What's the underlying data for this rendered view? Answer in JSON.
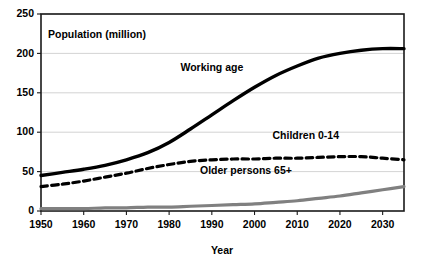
{
  "chart_data": {
    "type": "line",
    "title": "Population (million)",
    "xlabel": "Year",
    "ylabel": "",
    "xlim": [
      1950,
      2035
    ],
    "ylim": [
      0,
      250
    ],
    "grid": "horizontal",
    "legend_position": "inline-labels",
    "y_ticks": [
      0,
      50,
      100,
      150,
      200,
      250
    ],
    "x_ticks": [
      1950,
      1960,
      1970,
      1980,
      1990,
      2000,
      2010,
      2020,
      2030
    ],
    "x": [
      1950,
      1955,
      1960,
      1965,
      1970,
      1975,
      1980,
      1985,
      1990,
      1995,
      2000,
      2005,
      2010,
      2015,
      2020,
      2025,
      2030,
      2035
    ],
    "series": [
      {
        "name": "Working age",
        "color": "#000000",
        "style": "solid",
        "width": 3.4,
        "label_x": 1990,
        "label_y": 178,
        "values": [
          45,
          49,
          53,
          58,
          65,
          74,
          87,
          104,
          122,
          140,
          157,
          172,
          184,
          194,
          200,
          204,
          206,
          206
        ]
      },
      {
        "name": "Children 0-14",
        "color": "#000000",
        "style": "dashed",
        "width": 3.2,
        "label_x": 2012,
        "label_y": 92,
        "values": [
          31,
          34,
          38,
          43,
          48,
          54,
          59,
          63,
          65,
          66,
          66,
          67,
          67,
          68,
          69,
          69,
          67,
          65
        ]
      },
      {
        "name": "Older persons 65+",
        "color": "#808080",
        "style": "solid",
        "width": 3.2,
        "label_x": 1998,
        "label_y": 47,
        "values": [
          3,
          3,
          3,
          4,
          4,
          5,
          5,
          6,
          7,
          8,
          9,
          11,
          13,
          16,
          19,
          23,
          27,
          31
        ]
      }
    ]
  }
}
